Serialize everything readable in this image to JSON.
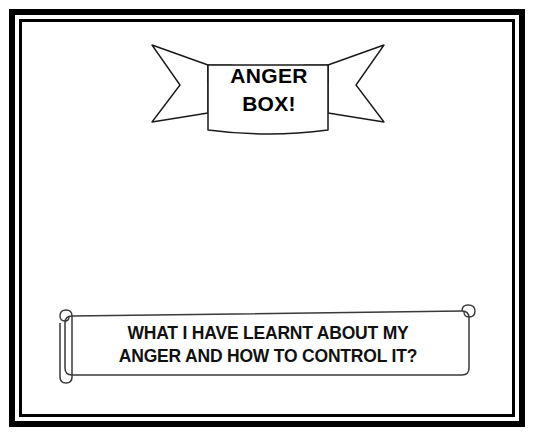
{
  "page": {
    "background_color": "#ffffff",
    "frame_color": "#000000",
    "ink_color": "#000000"
  },
  "banner": {
    "name": "anger-box-banner",
    "line1": "ANGER",
    "line2": "BOX!",
    "fold_shadow_color": "#d9d9d9",
    "panel_fill": "#ffffff",
    "stroke_color": "#1a1a1a"
  },
  "scroll": {
    "name": "question-scroll",
    "line1": "WHAT I HAVE LEARNT ABOUT MY",
    "line2": "ANGER AND HOW TO CONTROL IT?",
    "fill": "#ffffff",
    "stroke_color": "#3a3a3a"
  }
}
